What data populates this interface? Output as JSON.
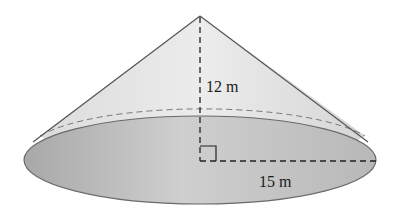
{
  "figure": {
    "type": "right circular cone",
    "height_label": "12 m",
    "radius_label": "15 m",
    "right_angle_marker": true
  },
  "colors": {
    "cone_surface": "#e4e4e4",
    "base_fill": "#bdbdbd",
    "outline": "#6a6a6a",
    "dashed": "#222222"
  }
}
